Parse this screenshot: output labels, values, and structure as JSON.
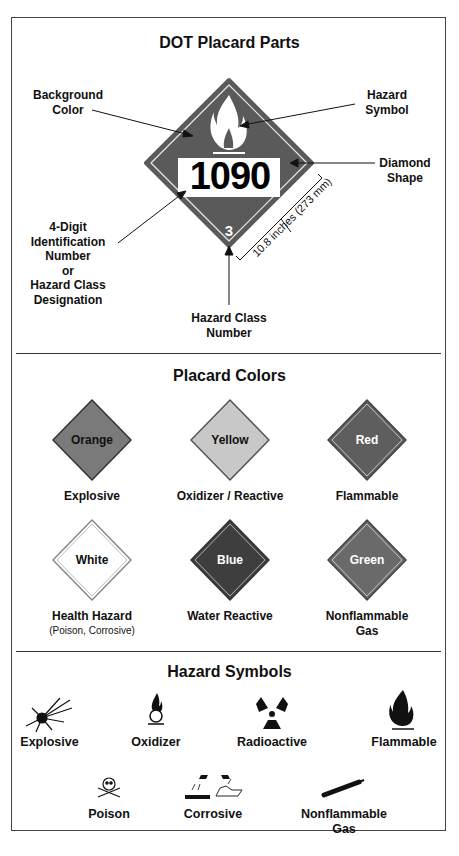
{
  "parts": {
    "title": "DOT Placard Parts",
    "placard": {
      "id_number": "1090",
      "class_number": "3",
      "background_color": "#5a5a5a"
    },
    "labels": {
      "background_color_1": "Background",
      "background_color_2": "Color",
      "hazard_symbol_1": "Hazard",
      "hazard_symbol_2": "Symbol",
      "diamond_shape_1": "Diamond",
      "diamond_shape_2": "Shape",
      "id_1": "4-Digit",
      "id_2": "Identification",
      "id_3": "Number",
      "id_4": "or",
      "id_5": "Hazard Class",
      "id_6": "Designation",
      "class_1": "Hazard Class",
      "class_2": "Number",
      "dimension": "10.8 inches (273 mm)"
    }
  },
  "colors": {
    "title": "Placard Colors",
    "items": [
      {
        "swatch": "Orange",
        "meaning": "Explosive",
        "sub": "",
        "fill": "#7a7a7a",
        "text": "#111111"
      },
      {
        "swatch": "Yellow",
        "meaning": "Oxidizer / Reactive",
        "sub": "",
        "fill": "#c8c8c8",
        "text": "#111111"
      },
      {
        "swatch": "Red",
        "meaning": "Flammable",
        "sub": "",
        "fill": "#5e5e5e",
        "text": "#ffffff"
      },
      {
        "swatch": "White",
        "meaning": "Health Hazard",
        "sub": "(Poison, Corrosive)",
        "fill": "#ffffff",
        "text": "#111111"
      },
      {
        "swatch": "Blue",
        "meaning": "Water Reactive",
        "sub": "",
        "fill": "#3e3e3e",
        "text": "#ffffff"
      },
      {
        "swatch": "Green",
        "meaning": "Nonflammable",
        "sub": "Gas",
        "fill": "#6a6a6a",
        "text": "#ffffff"
      }
    ]
  },
  "symbols": {
    "title": "Hazard Symbols",
    "items": [
      {
        "label": "Explosive",
        "icon": "explosion-icon"
      },
      {
        "label": "Oxidizer",
        "icon": "flame-over-circle-icon"
      },
      {
        "label": "Radioactive",
        "icon": "trefoil-icon"
      },
      {
        "label": "Flammable",
        "icon": "flame-icon"
      },
      {
        "label": "Poison",
        "icon": "skull-crossbones-icon"
      },
      {
        "label": "Corrosive",
        "icon": "corrosive-icon"
      },
      {
        "label": "Nonflammable",
        "label2": "Gas",
        "icon": "gas-cylinder-icon"
      }
    ]
  }
}
